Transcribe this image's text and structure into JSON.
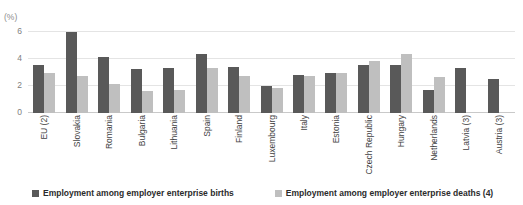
{
  "chart_data": {
    "type": "bar",
    "title": "",
    "clipped_title": "",
    "unit_label": "(%)",
    "xlabel": "",
    "ylabel": "",
    "ylim": [
      0,
      6
    ],
    "yticks": [
      0,
      2,
      4,
      6
    ],
    "grid": true,
    "legend_position": "bottom",
    "categories": [
      "EU (2)",
      "Slovakia",
      "Romania",
      "Bulgaria",
      "Lithuania",
      "Spain",
      "Finland",
      "Luxembourg",
      "Italy",
      "Estonia",
      "Czech Republic",
      "Hungary",
      "Netherlands",
      "Latvia (3)",
      "Austria (3)"
    ],
    "series": [
      {
        "name": "Employment among employer enterprise births",
        "color": "#595959",
        "values": [
          3.5,
          5.9,
          4.1,
          3.2,
          3.3,
          4.3,
          3.4,
          2.0,
          2.8,
          2.9,
          3.5,
          3.5,
          1.7,
          3.3,
          2.5
        ]
      },
      {
        "name": "Employment among employer enterprise deaths (4)",
        "color": "#bfbfbf",
        "values": [
          2.9,
          2.7,
          2.1,
          1.6,
          1.7,
          3.3,
          2.7,
          1.8,
          2.7,
          2.9,
          3.8,
          4.3,
          2.6,
          null,
          null
        ]
      }
    ]
  },
  "colors": {
    "births": "#595959",
    "deaths": "#bfbfbf",
    "grid": "#e4e4e4",
    "axis": "#c9c9c9",
    "tick_text": "#808080",
    "category_text": "#3f3f3f",
    "legend_text": "#2b2b2b",
    "background": "#ffffff"
  }
}
